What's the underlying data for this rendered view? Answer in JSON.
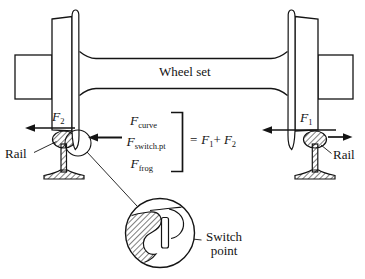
{
  "labels": {
    "wheel_set": "Wheel set",
    "rail_left": "Rail",
    "rail_right": "Rail",
    "switch_point": "Switch point"
  },
  "forces": {
    "f2": {
      "sym": "F",
      "sub": "2"
    },
    "f1": {
      "sym": "F",
      "sub": "1"
    },
    "curve": {
      "sym": "F",
      "sub": "curve"
    },
    "switch_pt": {
      "sym": "F",
      "sub": "switch.pt"
    },
    "frog": {
      "sym": "F",
      "sub": "frog"
    }
  },
  "equation": {
    "equals": "=",
    "f1": {
      "sym": "F",
      "sub": "1"
    },
    "plus": "+",
    "f2": {
      "sym": "F",
      "sub": "2"
    }
  },
  "colors": {
    "ink": "#141414",
    "background": "#ffffff"
  }
}
